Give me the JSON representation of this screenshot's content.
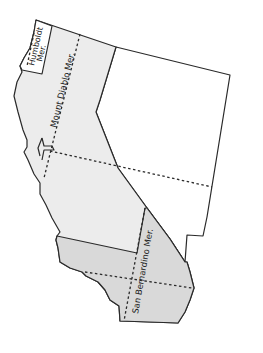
{
  "map": {
    "title": "",
    "regions": [
      {
        "name": "California (Mount Diablo region)",
        "fill": "#ececec"
      },
      {
        "name": "Nevada",
        "fill": "#ffffff"
      },
      {
        "name": "Humboldt Meridian region",
        "fill": "#ffffff"
      },
      {
        "name": "San Bernardino Meridian region",
        "fill": "#d9d9d9"
      }
    ],
    "labels": {
      "humboldt_line1": "Humboldt",
      "humboldt_line2": "Mer.",
      "mount_diablo": "Mount Diablo Mer.",
      "san_bernardino": "San Bernardino Mer."
    }
  }
}
